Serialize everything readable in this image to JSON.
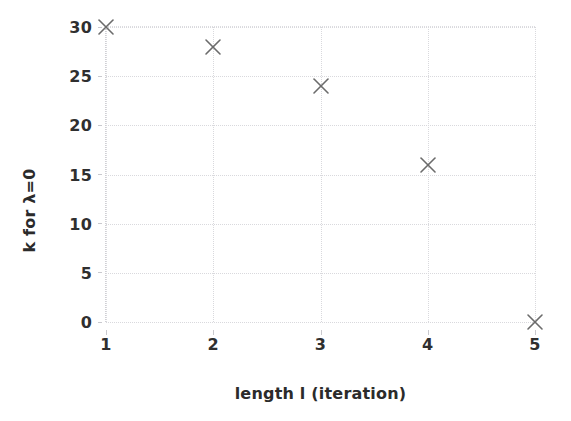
{
  "chart_data": {
    "type": "scatter",
    "title": "",
    "xlabel": "length l (iteration)",
    "ylabel": "k for λ=0",
    "x": [
      1,
      2,
      3,
      4,
      5
    ],
    "values": [
      30,
      28,
      24,
      16,
      0
    ],
    "points": [
      {
        "x": 1,
        "y": 30,
        "label": "(1, 30)"
      },
      {
        "x": 2,
        "y": 28,
        "label": "(2, 28)"
      },
      {
        "x": 3,
        "y": 24,
        "label": "(3, 24)"
      },
      {
        "x": 4,
        "y": 16,
        "label": "(4, 16)"
      },
      {
        "x": 5,
        "y": 0,
        "label": "(5, 0)"
      }
    ],
    "xticks": [
      "1",
      "2",
      "3",
      "4",
      "5"
    ],
    "xtick_values": [
      1,
      2,
      3,
      4,
      5
    ],
    "yticks": [
      "0",
      "5",
      "10",
      "15",
      "20",
      "25",
      "30"
    ],
    "ytick_values": [
      0,
      5,
      10,
      15,
      20,
      25,
      30
    ],
    "xlim": [
      1,
      5
    ],
    "ylim": [
      0,
      30
    ],
    "grid": true,
    "legend": null,
    "marker": "x",
    "marker_color": "#6b6b6b",
    "grid_color": "#d9d9dd",
    "text_color": "#2b2b2b",
    "background": "#ffffff"
  }
}
